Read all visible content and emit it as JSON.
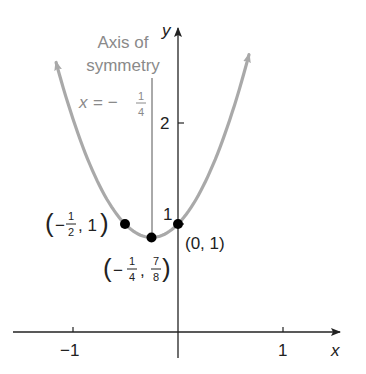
{
  "chart_data": {
    "type": "line",
    "title": "",
    "function": "y = 2x^2 + x + 1",
    "xlabel": "x",
    "ylabel": "y",
    "xlim": [
      -1.7,
      1.55
    ],
    "ylim": [
      -0.25,
      2.35
    ],
    "grid": false,
    "x_ticks": [
      {
        "value": -1,
        "label": "−1"
      },
      {
        "value": 1,
        "label": "1"
      }
    ],
    "y_ticks": [
      {
        "value": 1,
        "label": "1"
      },
      {
        "value": 2,
        "label": "2"
      }
    ],
    "curve": {
      "x_range": [
        -1.15,
        0.67
      ],
      "color": "#a9a9a9",
      "arrows_both_ends": true
    },
    "points": [
      {
        "x": -0.5,
        "y": 1,
        "label": "(−1/2, 1)"
      },
      {
        "x": -0.25,
        "y": 0.875,
        "label": "(−1/4, 7/8)"
      },
      {
        "x": 0,
        "y": 1,
        "label": "(0, 1)"
      }
    ],
    "annotations": [
      {
        "text": "Axis of symmetry",
        "line": "x = −1/4"
      }
    ]
  },
  "labels": {
    "axis_title_line1": "Axis of",
    "axis_title_line2": "symmetry",
    "eq_x": "x",
    "eq_equals": "= −",
    "eq_num": "1",
    "eq_den": "4",
    "y_axis": "y",
    "x_axis": "x",
    "tick_y2": "2",
    "tick_y1": "1",
    "tick_xm1": "−1",
    "tick_x1": "1",
    "pt1_open": "(",
    "pt1_minus": "−",
    "pt1_num": "1",
    "pt1_den": "2",
    "pt1_rest": ", 1",
    "pt1_close": ")",
    "pt2_open": "(",
    "pt2_minus": "−",
    "pt2_num": "1",
    "pt2_den": "4",
    "pt2_comma": ",",
    "pt2_num2": "7",
    "pt2_den2": "8",
    "pt2_close": ")",
    "pt3": "(0, 1)"
  },
  "colors": {
    "curve": "#a9a9a9",
    "axis": "#222222",
    "symmetry_line": "#555555",
    "annotation_text": "#8a8a8a",
    "point": "#000000"
  }
}
